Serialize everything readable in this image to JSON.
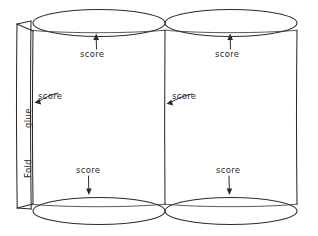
{
  "diagram": {
    "style": "hand-drawn pencil line drawing",
    "background_color": "#ffffff",
    "ink_color": "#2b2b2b",
    "labels": {
      "score": "score",
      "glue": "glue",
      "fold": "Fold"
    },
    "annotations": [
      {
        "name": "score-top-left",
        "text": "score",
        "arrow": "up",
        "points_to": "top-left-cylinder-rim"
      },
      {
        "name": "score-top-right",
        "text": "score",
        "arrow": "up",
        "points_to": "top-right-cylinder-rim"
      },
      {
        "name": "score-left",
        "text": "score",
        "arrow": "left",
        "points_to": "left-fold-line"
      },
      {
        "name": "score-middle",
        "text": "score",
        "arrow": "left",
        "points_to": "center-divider-line"
      },
      {
        "name": "score-bottom-left",
        "text": "score",
        "arrow": "down",
        "points_to": "bottom-left-cylinder-rim"
      },
      {
        "name": "score-bottom-right",
        "text": "score",
        "arrow": "down",
        "points_to": "bottom-right-cylinder-rim"
      }
    ],
    "edge_labels": [
      {
        "name": "glue-flap-label",
        "text": "glue",
        "orientation": "vertical"
      },
      {
        "name": "fold-edge-label",
        "text": "Fold",
        "orientation": "vertical"
      }
    ]
  }
}
